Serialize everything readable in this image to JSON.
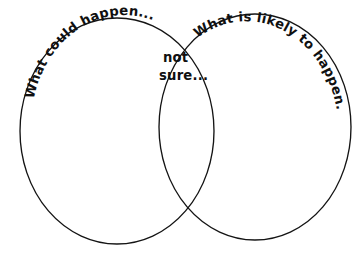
{
  "figure": {
    "type": "venn-diagram",
    "set_count": 2,
    "background_color": "#ffffff",
    "stroke_color": "#141414",
    "text_color": "#101010",
    "style": "hand-drawn"
  },
  "labels": {
    "left_set": "What could happen...",
    "right_set": "What is likely to happen....",
    "intersection_line1": "not",
    "intersection_line2": "sure..."
  },
  "geometry": {
    "left_circle": {
      "cx": 117,
      "cy": 131,
      "rx": 97,
      "ry": 113
    },
    "right_circle": {
      "cx": 255,
      "cy": 127,
      "rx": 96,
      "ry": 113
    }
  }
}
